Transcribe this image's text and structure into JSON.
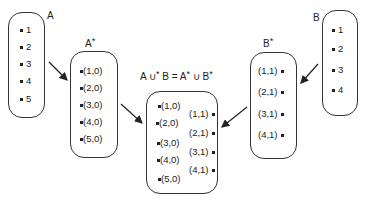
{
  "sets": {
    "A": {
      "label": "A",
      "items": [
        "1",
        "2",
        "3",
        "4",
        "5"
      ]
    },
    "A_star": {
      "label": "A",
      "star": "*",
      "items": [
        "(1,0)",
        "(2,0)",
        "(3,0)",
        "(4,0)",
        "(5,0)"
      ]
    },
    "B": {
      "label": "B",
      "items": [
        "1",
        "2",
        "3",
        "4"
      ]
    },
    "B_star": {
      "label": "B",
      "star": "*",
      "items": [
        "(1,1)",
        "(2,1)",
        "(3,1)",
        "(4,1)"
      ]
    },
    "union": {
      "title_parts": {
        "a": "A ∪",
        "star1": "*",
        "b": " B = A",
        "star2": "*",
        "c": " ∪ B",
        "star3": "*"
      },
      "left_items": [
        "(1,0)",
        "(2,0)",
        "(3,0)",
        "(4,0)",
        "(5,0)"
      ],
      "right_items": [
        "(1,1)",
        "(2,1)",
        "(3,1)",
        "(4,1)"
      ]
    }
  }
}
